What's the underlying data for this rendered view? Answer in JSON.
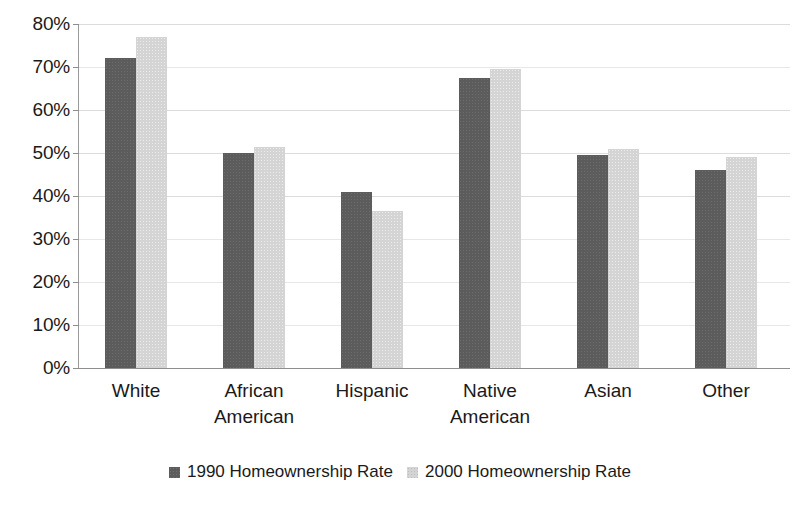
{
  "chart_data": {
    "type": "bar",
    "title": "",
    "subtitle": "",
    "xlabel": "",
    "ylabel": "",
    "categories": [
      "White",
      "African American",
      "Hispanic",
      "Native American",
      "Asian",
      "Other"
    ],
    "category_lines": [
      [
        "White"
      ],
      [
        "African",
        "American"
      ],
      [
        "Hispanic"
      ],
      [
        "Native",
        "American"
      ],
      [
        "Asian"
      ],
      [
        "Other"
      ]
    ],
    "series": [
      {
        "name": "1990 Homeownership Rate",
        "color": "#5c5c5c",
        "values": [
          72.0,
          50.0,
          41.0,
          67.5,
          49.5,
          46.0
        ]
      },
      {
        "name": "2000 Homeownership Rate",
        "color": "#d4d4d4",
        "values": [
          77.0,
          51.5,
          36.5,
          69.5,
          51.0,
          49.0
        ]
      }
    ],
    "ylim": [
      0,
      80
    ],
    "ytick_values": [
      0,
      10,
      20,
      30,
      40,
      50,
      60,
      70,
      80
    ],
    "ytick_labels": [
      "0%",
      "10%",
      "20%",
      "30%",
      "40%",
      "50%",
      "60%",
      "70%",
      "80%"
    ],
    "grid": true,
    "grid_axis": "y",
    "legend_position": "bottom",
    "value_format": "percent",
    "bar_gap": "none",
    "background_color": "#ffffff",
    "gridline_color": "#dcdcdc",
    "axis_color": "#8e8e8e"
  },
  "legend": {
    "entries": [
      {
        "label": "1990 Homeownership Rate"
      },
      {
        "label": "2000 Homeownership Rate"
      }
    ]
  }
}
